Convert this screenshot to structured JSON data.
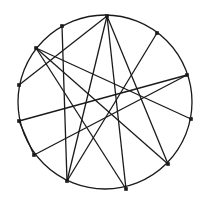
{
  "diagram": {
    "type": "circle-chord-graph",
    "width": 208,
    "height": 202,
    "stroke_color": "#1a1a1a",
    "background": "#ffffff",
    "circle": {
      "cx": 105,
      "cy": 102,
      "r": 87
    },
    "points": [
      {
        "id": "A",
        "x": 107,
        "y": 16
      },
      {
        "id": "B",
        "x": 62,
        "y": 26
      },
      {
        "id": "C",
        "x": 36,
        "y": 48
      },
      {
        "id": "D",
        "x": 19,
        "y": 85
      },
      {
        "id": "E",
        "x": 19,
        "y": 121
      },
      {
        "id": "F",
        "x": 34,
        "y": 155
      },
      {
        "id": "G",
        "x": 67,
        "y": 181
      },
      {
        "id": "H",
        "x": 126,
        "y": 189
      },
      {
        "id": "I",
        "x": 168,
        "y": 164
      },
      {
        "id": "J",
        "x": 191,
        "y": 119
      },
      {
        "id": "K",
        "x": 187,
        "y": 75
      },
      {
        "id": "L",
        "x": 157,
        "y": 33
      }
    ],
    "edges": [
      [
        "A",
        "D"
      ],
      [
        "A",
        "G"
      ],
      [
        "A",
        "H"
      ],
      [
        "A",
        "I"
      ],
      [
        "B",
        "G"
      ],
      [
        "C",
        "J"
      ],
      [
        "C",
        "I"
      ],
      [
        "C",
        "H"
      ],
      [
        "E",
        "K"
      ],
      [
        "F",
        "K"
      ],
      [
        "G",
        "L"
      ],
      [
        "E",
        "F"
      ]
    ]
  }
}
